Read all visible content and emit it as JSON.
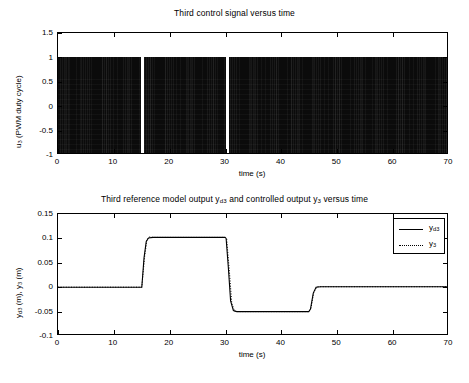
{
  "figure": {
    "width": 469,
    "height": 383,
    "background": "#ffffff",
    "line_color": "#000000"
  },
  "chart_data": [
    {
      "id": "top",
      "type": "line",
      "title": "Third control signal versus time",
      "xlabel": "time (s)",
      "ylabel": "u_3 (PWM duty cycle)",
      "ylabel_parts": {
        "base": "u",
        "sub": "3",
        "rest": " (PWM duty cycle)"
      },
      "xlim": [
        0,
        70
      ],
      "ylim": [
        -1,
        1.5
      ],
      "xticks": [
        0,
        10,
        20,
        30,
        40,
        50,
        60,
        70
      ],
      "xticklabels": [
        "0",
        "10",
        "20",
        "30",
        "40",
        "50",
        "60",
        "70"
      ],
      "yticks": [
        -1,
        -0.5,
        0,
        0.5,
        1,
        1.5
      ],
      "yticklabels": [
        "-1",
        "-0.5",
        "0",
        "0.5",
        "1",
        "1.5"
      ],
      "grid": false,
      "legend": null,
      "description": "High-frequency PWM switching signal saturating between -1 and 1 for nearly the whole record; the duty cycle collapses to zero (thin white vertical gaps) at the two reference step instants.",
      "series": [
        {
          "name": "u_3",
          "style": "solid",
          "color": "#0b0b0b",
          "saturation_band": [
            -1,
            1
          ],
          "dense_segments": [
            {
              "t_start": 0.0,
              "t_end": 14.9
            },
            {
              "t_start": 15.4,
              "t_end": 30.1
            },
            {
              "t_start": 30.7,
              "t_end": 70.0
            }
          ],
          "zero_duty_gaps": [
            {
              "t_start": 14.9,
              "t_end": 15.4
            },
            {
              "t_start": 30.1,
              "t_end": 30.7
            }
          ]
        }
      ]
    },
    {
      "id": "bottom",
      "type": "line",
      "title": "Third reference model output y_d3 and controlled output y_3 versus time",
      "title_parts": [
        {
          "text": "Third reference model output y",
          "sub": null
        },
        {
          "text": "",
          "sub": "d3"
        },
        {
          "text": " and controlled output y",
          "sub": null
        },
        {
          "text": "",
          "sub": "3"
        },
        {
          "text": " versus time",
          "sub": null
        }
      ],
      "xlabel": "time (s)",
      "ylabel": "y_d3 (m), y_3 (m)",
      "xlim": [
        0,
        70
      ],
      "ylim": [
        -0.1,
        0.15
      ],
      "xticks": [
        0,
        10,
        20,
        30,
        40,
        50,
        60,
        70
      ],
      "xticklabels": [
        "0",
        "10",
        "20",
        "30",
        "40",
        "50",
        "60",
        "70"
      ],
      "yticks": [
        -0.1,
        -0.05,
        0,
        0.05,
        0.1,
        0.15
      ],
      "yticklabels": [
        "-0.1",
        "-0.05",
        "0",
        "0.05",
        "0.1",
        "0.15"
      ],
      "grid": false,
      "legend": {
        "position": "upper-right",
        "entries": [
          {
            "label": "y_d3",
            "base": "y",
            "sub": "d3",
            "style": "solid"
          },
          {
            "label": "y_3",
            "base": "y",
            "sub": "3",
            "style": "dotted"
          }
        ]
      },
      "description": "Square-wave reference: 0 m until t=15 s, +0.10 m from 15 to 30 s, -0.05 m from 30 to 45 s, then back to 0 m. The controlled output tracks the reference almost exactly with small transient overshoot at each step.",
      "series": [
        {
          "name": "y_d3",
          "style": "solid",
          "color": "#000000",
          "points": [
            {
              "t": 0,
              "y": 0.0
            },
            {
              "t": 14.9,
              "y": 0.0
            },
            {
              "t": 15.0,
              "y": 0.0
            },
            {
              "t": 15.4,
              "y": 0.06
            },
            {
              "t": 15.8,
              "y": 0.094
            },
            {
              "t": 16.2,
              "y": 0.101
            },
            {
              "t": 17.0,
              "y": 0.102
            },
            {
              "t": 29.9,
              "y": 0.102
            },
            {
              "t": 30.1,
              "y": 0.1
            },
            {
              "t": 30.5,
              "y": 0.04
            },
            {
              "t": 30.9,
              "y": -0.028
            },
            {
              "t": 31.4,
              "y": -0.048
            },
            {
              "t": 32.0,
              "y": -0.05
            },
            {
              "t": 44.9,
              "y": -0.05
            },
            {
              "t": 45.2,
              "y": -0.045
            },
            {
              "t": 45.7,
              "y": -0.012
            },
            {
              "t": 46.2,
              "y": 0.0
            },
            {
              "t": 47.0,
              "y": 0.001
            },
            {
              "t": 70.0,
              "y": 0.001
            }
          ]
        },
        {
          "name": "y_3",
          "style": "dotted",
          "color": "#000000",
          "points": [
            {
              "t": 0,
              "y": 0.0
            },
            {
              "t": 14.9,
              "y": 0.0
            },
            {
              "t": 15.0,
              "y": 0.0
            },
            {
              "t": 15.5,
              "y": 0.062
            },
            {
              "t": 15.9,
              "y": 0.096
            },
            {
              "t": 16.3,
              "y": 0.103
            },
            {
              "t": 17.2,
              "y": 0.102
            },
            {
              "t": 29.9,
              "y": 0.102
            },
            {
              "t": 30.2,
              "y": 0.098
            },
            {
              "t": 30.7,
              "y": 0.03
            },
            {
              "t": 31.1,
              "y": -0.032
            },
            {
              "t": 31.6,
              "y": -0.049
            },
            {
              "t": 32.2,
              "y": -0.05
            },
            {
              "t": 44.9,
              "y": -0.05
            },
            {
              "t": 45.3,
              "y": -0.043
            },
            {
              "t": 45.8,
              "y": -0.01
            },
            {
              "t": 46.4,
              "y": 0.001
            },
            {
              "t": 47.2,
              "y": 0.001
            },
            {
              "t": 70.0,
              "y": 0.001
            }
          ]
        }
      ]
    }
  ]
}
